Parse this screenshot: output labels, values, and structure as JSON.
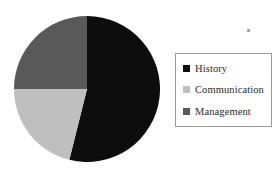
{
  "figure": {
    "background_color": "#ffffff",
    "width": 280,
    "height": 170
  },
  "chart_data": {
    "type": "pie",
    "title": "",
    "subtitle": "",
    "xlabel": "",
    "ylabel": "",
    "grid": false,
    "legend_position": "right",
    "categories": [
      "History",
      "Communication",
      "Management"
    ],
    "values": [
      54,
      21,
      25
    ],
    "value_unit": "percent",
    "colors": [
      "#0d0d0d",
      "#bfbfbf",
      "#595959"
    ],
    "start_angle_deg": 0,
    "direction": "clockwise",
    "slices": [
      {
        "label": "History",
        "value": 54,
        "color": "#0d0d0d",
        "start_deg": 0,
        "end_deg": 194
      },
      {
        "label": "Communication",
        "value": 21,
        "color": "#bfbfbf",
        "start_deg": 194,
        "end_deg": 270
      },
      {
        "label": "Management",
        "value": 25,
        "color": "#595959",
        "start_deg": 270,
        "end_deg": 360
      }
    ],
    "geometry": {
      "center_x": 87,
      "center_y": 89,
      "radius": 73
    }
  },
  "legend": {
    "border_color": "#9a9a9a",
    "background_color": "#ffffff",
    "items": [
      {
        "label": "History",
        "color": "#0d0d0d"
      },
      {
        "label": "Communication",
        "color": "#bfbfbf"
      },
      {
        "label": "Management",
        "color": "#595959"
      }
    ]
  },
  "artifact": {
    "name": "speck-mark",
    "color": "#9b9b9b"
  }
}
